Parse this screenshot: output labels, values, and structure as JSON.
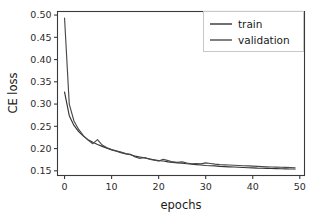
{
  "chart_data": {
    "type": "line",
    "title": "",
    "xlabel": "epochs",
    "ylabel": "CE loss",
    "xlim": [
      -1.5,
      51
    ],
    "ylim": [
      0.1395,
      0.508
    ],
    "xticks": [
      0,
      10,
      20,
      30,
      40,
      50
    ],
    "xtick_labels": [
      "0",
      "10",
      "20",
      "30",
      "40",
      "50"
    ],
    "yticks": [
      0.15,
      0.2,
      0.25,
      0.3,
      0.35,
      0.4,
      0.45,
      0.5
    ],
    "ytick_labels": [
      "0.15",
      "0.20",
      "0.25",
      "0.30",
      "0.35",
      "0.40",
      "0.45",
      "0.50"
    ],
    "grid": false,
    "legend_position": "upper right",
    "x": [
      0,
      1,
      2,
      3,
      4,
      5,
      6,
      7,
      8,
      9,
      10,
      11,
      12,
      13,
      14,
      15,
      16,
      17,
      18,
      19,
      20,
      21,
      22,
      23,
      24,
      25,
      26,
      27,
      28,
      29,
      30,
      31,
      32,
      33,
      34,
      35,
      36,
      37,
      38,
      39,
      40,
      41,
      42,
      43,
      44,
      45,
      46,
      47,
      48,
      49
    ],
    "series": [
      {
        "name": "train",
        "color": "#333333",
        "values": [
          0.327,
          0.274,
          0.252,
          0.238,
          0.228,
          0.22,
          0.214,
          0.209,
          0.205,
          0.201,
          0.197,
          0.194,
          0.191,
          0.188,
          0.186,
          0.183,
          0.181,
          0.179,
          0.177,
          0.175,
          0.173,
          0.172,
          0.17,
          0.169,
          0.168,
          0.167,
          0.166,
          0.165,
          0.164,
          0.163,
          0.162,
          0.1615,
          0.161,
          0.16,
          0.1595,
          0.159,
          0.1585,
          0.158,
          0.1575,
          0.157,
          0.1565,
          0.156,
          0.1558,
          0.1555,
          0.1552,
          0.155,
          0.1547,
          0.1545,
          0.1542,
          0.154
        ]
      },
      {
        "name": "validation",
        "color": "#4a4a4a",
        "values": [
          0.493,
          0.3,
          0.262,
          0.243,
          0.229,
          0.219,
          0.211,
          0.22,
          0.208,
          0.202,
          0.198,
          0.195,
          0.192,
          0.189,
          0.187,
          0.181,
          0.178,
          0.18,
          0.176,
          0.174,
          0.172,
          0.176,
          0.173,
          0.17,
          0.169,
          0.17,
          0.1675,
          0.166,
          0.1665,
          0.1655,
          0.168,
          0.1665,
          0.165,
          0.164,
          0.1635,
          0.163,
          0.1625,
          0.162,
          0.1615,
          0.161,
          0.1605,
          0.16,
          0.1595,
          0.159,
          0.1587,
          0.1583,
          0.158,
          0.1577,
          0.1574,
          0.157
        ]
      }
    ],
    "legend_entries": [
      {
        "label": "train",
        "color": "#333333"
      },
      {
        "label": "validation",
        "color": "#4a4a4a"
      }
    ]
  },
  "figure": {
    "background_color": "#ffffff",
    "axes_color": "#3a3a3a"
  }
}
